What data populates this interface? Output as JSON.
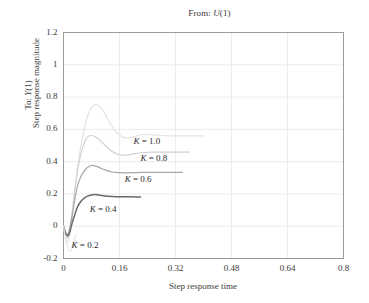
{
  "chart_data": {
    "type": "line",
    "title": "From: U(1)",
    "title_prefix": "From: ",
    "title_var": "U",
    "title_suffix": "(1)",
    "xlabel": "Step response time",
    "ylabel_primary": "Step response magnitude",
    "ylabel_secondary_prefix": "To: ",
    "ylabel_secondary_var": "Y",
    "ylabel_secondary_suffix": "(1)",
    "xlim": [
      0,
      0.8
    ],
    "ylim": [
      -0.2,
      1.2
    ],
    "xticks": [
      "0",
      "0.16",
      "0.32",
      "0.48",
      "0.64",
      "0.8"
    ],
    "xtick_values": [
      0,
      0.16,
      0.32,
      0.48,
      0.64,
      0.8
    ],
    "yticks": [
      "1.2",
      "1",
      "0.8",
      "0.6",
      "0.4",
      "0.2",
      "0",
      "-0.2"
    ],
    "ytick_values": [
      1.2,
      1.0,
      0.8,
      0.6,
      0.4,
      0.2,
      0,
      -0.2
    ],
    "grid": true,
    "grid_color": "#e2e2e2",
    "legend_position": "inline-annotations",
    "series": [
      {
        "name": "K = 1.0",
        "label_prefix": "K",
        "label_suffix": " = 1.0",
        "color": "#e3e3e3",
        "width": 1.2,
        "x": [
          0,
          0.004,
          0.008,
          0.012,
          0.016,
          0.02,
          0.026,
          0.032,
          0.04,
          0.05,
          0.06,
          0.07,
          0.08,
          0.09,
          0.1,
          0.11,
          0.12,
          0.13,
          0.14,
          0.15,
          0.16,
          0.17,
          0.18,
          0.19,
          0.2,
          0.21,
          0.22,
          0.23,
          0.24,
          0.26,
          0.28,
          0.3,
          0.32,
          0.34,
          0.36,
          0.38,
          0.4
        ],
        "y": [
          0,
          -0.05,
          -0.09,
          -0.1,
          -0.07,
          -0.01,
          0.1,
          0.22,
          0.36,
          0.5,
          0.61,
          0.69,
          0.735,
          0.755,
          0.75,
          0.725,
          0.69,
          0.65,
          0.615,
          0.585,
          0.565,
          0.552,
          0.547,
          0.548,
          0.553,
          0.56,
          0.565,
          0.568,
          0.568,
          0.565,
          0.562,
          0.56,
          0.56,
          0.56,
          0.56,
          0.56,
          0.56
        ]
      },
      {
        "name": "K = 0.8",
        "label_prefix": "K",
        "label_suffix": " = 0.8",
        "color": "#d2d2d2",
        "width": 1.2,
        "x": [
          0,
          0.004,
          0.008,
          0.012,
          0.016,
          0.02,
          0.026,
          0.032,
          0.04,
          0.05,
          0.06,
          0.07,
          0.08,
          0.09,
          0.1,
          0.11,
          0.12,
          0.13,
          0.14,
          0.15,
          0.16,
          0.17,
          0.18,
          0.19,
          0.2,
          0.21,
          0.22,
          0.24,
          0.26,
          0.28,
          0.3,
          0.32,
          0.34,
          0.36
        ],
        "y": [
          0,
          -0.04,
          -0.07,
          -0.07,
          -0.04,
          0.01,
          0.11,
          0.22,
          0.34,
          0.45,
          0.52,
          0.555,
          0.562,
          0.555,
          0.54,
          0.52,
          0.498,
          0.478,
          0.462,
          0.45,
          0.443,
          0.44,
          0.441,
          0.444,
          0.448,
          0.452,
          0.455,
          0.458,
          0.459,
          0.459,
          0.459,
          0.459,
          0.459,
          0.459
        ]
      },
      {
        "name": "K = 0.6",
        "label_prefix": "K",
        "label_suffix": " = 0.6",
        "color": "#a6a6a6",
        "width": 1.2,
        "x": [
          0,
          0.004,
          0.008,
          0.012,
          0.016,
          0.02,
          0.026,
          0.032,
          0.04,
          0.05,
          0.06,
          0.07,
          0.08,
          0.09,
          0.1,
          0.11,
          0.12,
          0.13,
          0.14,
          0.15,
          0.16,
          0.17,
          0.18,
          0.2,
          0.22,
          0.24,
          0.26,
          0.28,
          0.3,
          0.32,
          0.34
        ],
        "y": [
          0,
          -0.03,
          -0.05,
          -0.05,
          -0.03,
          0.01,
          0.08,
          0.16,
          0.25,
          0.31,
          0.345,
          0.367,
          0.376,
          0.374,
          0.366,
          0.356,
          0.348,
          0.341,
          0.336,
          0.333,
          0.332,
          0.331,
          0.331,
          0.332,
          0.333,
          0.334,
          0.334,
          0.334,
          0.334,
          0.334,
          0.334
        ]
      },
      {
        "name": "K = 0.4",
        "label_prefix": "K",
        "label_suffix": " = 0.4",
        "color": "#6a6a6a",
        "width": 1.5,
        "x": [
          0,
          0.004,
          0.008,
          0.012,
          0.016,
          0.02,
          0.026,
          0.032,
          0.04,
          0.05,
          0.06,
          0.07,
          0.08,
          0.09,
          0.1,
          0.11,
          0.12,
          0.13,
          0.14,
          0.15,
          0.16,
          0.17,
          0.18,
          0.19,
          0.2,
          0.21,
          0.22
        ],
        "y": [
          0,
          -0.03,
          -0.05,
          -0.06,
          -0.05,
          -0.02,
          0.03,
          0.07,
          0.12,
          0.155,
          0.175,
          0.188,
          0.194,
          0.196,
          0.193,
          0.19,
          0.187,
          0.185,
          0.184,
          0.183,
          0.183,
          0.183,
          0.183,
          0.182,
          0.182,
          0.181,
          0.181
        ]
      },
      {
        "name": "K = 0.2",
        "label_prefix": "K",
        "label_suffix": " = 0.2",
        "color": "#e9e9e9",
        "width": 1.2,
        "x": [
          0,
          0.003,
          0.006,
          0.009,
          0.012,
          0.015,
          0.018,
          0.022,
          0.026,
          0.03,
          0.036
        ],
        "y": [
          0,
          -0.04,
          -0.08,
          -0.11,
          -0.135,
          -0.15,
          -0.155,
          -0.15,
          -0.13,
          -0.1,
          -0.05
        ]
      }
    ],
    "annotations": [
      {
        "text": "K = 1.0",
        "x": 0.2,
        "y": 0.52
      },
      {
        "text": "K = 0.8",
        "x": 0.22,
        "y": 0.415
      },
      {
        "text": "K = 0.6",
        "x": 0.175,
        "y": 0.285
      },
      {
        "text": "K = 0.4",
        "x": 0.075,
        "y": 0.1
      },
      {
        "text": "K = 0.2",
        "x": 0.023,
        "y": -0.125
      }
    ]
  }
}
